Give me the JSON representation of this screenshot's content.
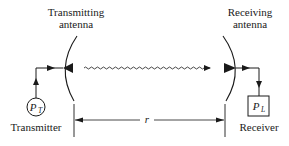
{
  "diagram": {
    "type": "radio-link",
    "labels": {
      "transmitting_antenna": [
        "Transmitting",
        "antenna"
      ],
      "receiving_antenna": [
        "Receiving",
        "antenna"
      ],
      "transmitter": "Transmitter",
      "receiver": "Receiver",
      "distance": "r",
      "transmit_power": {
        "symbol": "P",
        "subscript": "T"
      },
      "received_power": {
        "symbol": "P",
        "subscript": "L"
      }
    },
    "colors": {
      "ink": "#1a1a1a",
      "background": "#ffffff"
    }
  }
}
